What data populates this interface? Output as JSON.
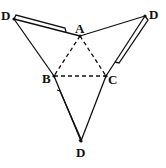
{
  "diagram": {
    "type": "tetrahedron-net",
    "points": {
      "A": {
        "label": "A",
        "x": 80,
        "y": 36
      },
      "B": {
        "label": "B",
        "x": 54,
        "y": 76
      },
      "C": {
        "label": "C",
        "x": 106,
        "y": 76
      },
      "D1": {
        "label": "D",
        "x": 14,
        "y": 19
      },
      "D2": {
        "label": "D",
        "x": 145,
        "y": 16
      },
      "D3": {
        "label": "D",
        "x": 81,
        "y": 141
      }
    },
    "solid_edges": [
      [
        "D1",
        "A"
      ],
      [
        "A",
        "D2"
      ],
      [
        "D1",
        "B"
      ],
      [
        "D2",
        "C"
      ],
      [
        "B",
        "D3"
      ],
      [
        "C",
        "D3"
      ]
    ],
    "dashed_edges": [
      [
        "A",
        "B"
      ],
      [
        "A",
        "C"
      ],
      [
        "B",
        "C"
      ]
    ],
    "flaps": [
      "D1-A",
      "D2-C",
      "B-D3"
    ],
    "colors": {
      "line": "#111111",
      "background": "#ffffff"
    }
  }
}
